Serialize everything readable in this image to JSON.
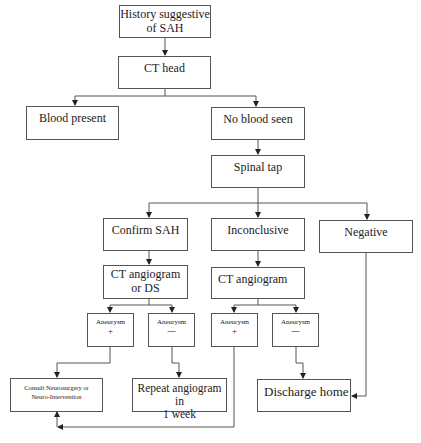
{
  "diagram": {
    "type": "flowchart",
    "nodes": {
      "history": {
        "line1": "History suggestive",
        "line2": "of SAH"
      },
      "ct_head": {
        "label": "CT head"
      },
      "blood_present": {
        "label": "Blood present"
      },
      "no_blood": {
        "label": "No blood seen"
      },
      "spinal_tap": {
        "label": "Spinal tap"
      },
      "confirm_sah": {
        "label": "Confirm SAH"
      },
      "inconclusive": {
        "label": "Inconclusive"
      },
      "negative": {
        "label": "Negative"
      },
      "ct_angio_ds": {
        "line1": "CT angiogram",
        "line2": "or DS"
      },
      "ct_angio": {
        "label": "CT angiogram"
      },
      "aneurysm_pos_1": {
        "line1": "Aneurysm",
        "line2": "+"
      },
      "aneurysm_neg_1": {
        "line1": "Aneurysm",
        "line2": "—"
      },
      "aneurysm_pos_2": {
        "line1": "Aneurysm",
        "line2": "+"
      },
      "aneurysm_neg_2": {
        "line1": "Aneurysm",
        "line2": "—"
      },
      "consult": {
        "line1": "Consult Neurosurgery or",
        "line2": "Neuro-Intervention"
      },
      "repeat_angio": {
        "line1": "Repeat angiogram in",
        "line2": "1 week"
      },
      "discharge": {
        "label": "Discharge home"
      }
    },
    "edges": [
      [
        "History suggestive of SAH",
        "CT head"
      ],
      [
        "CT head",
        "Blood present"
      ],
      [
        "CT head",
        "No blood seen"
      ],
      [
        "No blood seen",
        "Spinal tap"
      ],
      [
        "Spinal tap",
        "Confirm SAH"
      ],
      [
        "Spinal tap",
        "Inconclusive"
      ],
      [
        "Spinal tap",
        "Negative"
      ],
      [
        "Confirm SAH",
        "CT angiogram or DS"
      ],
      [
        "Inconclusive",
        "CT angiogram"
      ],
      [
        "CT angiogram or DS",
        "Aneurysm +"
      ],
      [
        "CT angiogram or DS",
        "Aneurysm —"
      ],
      [
        "CT angiogram",
        "Aneurysm +"
      ],
      [
        "CT angiogram",
        "Aneurysm —"
      ],
      [
        "Aneurysm + (DS)",
        "Consult Neurosurgery or Neuro-Intervention"
      ],
      [
        "Aneurysm — (DS)",
        "Repeat angiogram in 1 week"
      ],
      [
        "Aneurysm + (CT)",
        "Consult Neurosurgery or Neuro-Intervention"
      ],
      [
        "Aneurysm — (CT)",
        "Discharge home"
      ],
      [
        "Negative",
        "Discharge home"
      ]
    ],
    "colors": {
      "line": "#555555",
      "box_border": "#555555",
      "text": "#222222"
    }
  }
}
